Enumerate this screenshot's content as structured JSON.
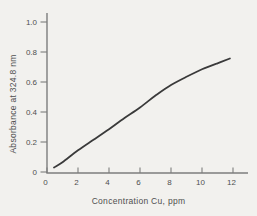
{
  "figure": {
    "background": "#f2f1ee",
    "axis_color": "#7d7d7d",
    "curve_color": "#3a3a3a",
    "text_color": "#4f4f4f"
  },
  "chart_data": {
    "type": "line",
    "title": "",
    "xlabel": "Concentration Cu, ppm",
    "ylabel": "Absorbance at 324.8 nm",
    "xlim": [
      0,
      13
    ],
    "ylim": [
      0,
      1.07
    ],
    "x_ticks": [
      0,
      2,
      4,
      6,
      8,
      10,
      12
    ],
    "x_tick_labels": [
      "0",
      "2",
      "4",
      "6",
      "8",
      "10",
      "12"
    ],
    "y_ticks": [
      0,
      0.2,
      0.4,
      0.6,
      0.8,
      1.0
    ],
    "y_tick_labels": [
      "0",
      "0.2",
      "0.4",
      "0.6",
      "0.8",
      "1.0"
    ],
    "grid": false,
    "legend": "none",
    "series": [
      {
        "name": "calibration-curve",
        "x": [
          0.45,
          1,
          2,
          3,
          4,
          5,
          6,
          7,
          8,
          9,
          10,
          11,
          11.8
        ],
        "y": [
          0.03,
          0.065,
          0.145,
          0.215,
          0.285,
          0.36,
          0.43,
          0.51,
          0.58,
          0.635,
          0.685,
          0.725,
          0.757
        ]
      }
    ]
  }
}
